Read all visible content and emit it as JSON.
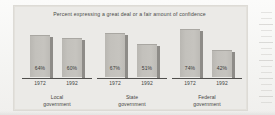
{
  "figure": {
    "title": "Percent expressing a great deal or a fair amount of confidence",
    "background_color": "#ebeae7",
    "bar_color": "#c3c1bc",
    "bar_shadow_color": "#8e8c88",
    "axis_color": "#4f4e4c",
    "text_color": "#44443f"
  },
  "chart_data": {
    "type": "bar",
    "title": "Percent expressing a great deal or a fair amount of confidence",
    "xlabel": "",
    "ylabel": "",
    "ylim": [
      0,
      100
    ],
    "grid": false,
    "legend_position": "none",
    "categories": [
      "Local government",
      "State government",
      "Federal government"
    ],
    "series": [
      {
        "name": "1972",
        "values": [
          64,
          67,
          74
        ]
      },
      {
        "name": "1992",
        "values": [
          60,
          51,
          42
        ]
      }
    ],
    "groups": [
      {
        "label_line1": "Local",
        "label_line2": "government",
        "bars": [
          {
            "year": "1972",
            "value": 64,
            "value_label": "64%"
          },
          {
            "year": "1992",
            "value": 60,
            "value_label": "60%"
          }
        ]
      },
      {
        "label_line1": "State",
        "label_line2": "government",
        "bars": [
          {
            "year": "1972",
            "value": 67,
            "value_label": "67%"
          },
          {
            "year": "1992",
            "value": 51,
            "value_label": "51%"
          }
        ]
      },
      {
        "label_line1": "Federal",
        "label_line2": "government",
        "bars": [
          {
            "year": "1972",
            "value": 74,
            "value_label": "74%"
          },
          {
            "year": "1992",
            "value": 42,
            "value_label": "42%"
          }
        ]
      }
    ]
  }
}
